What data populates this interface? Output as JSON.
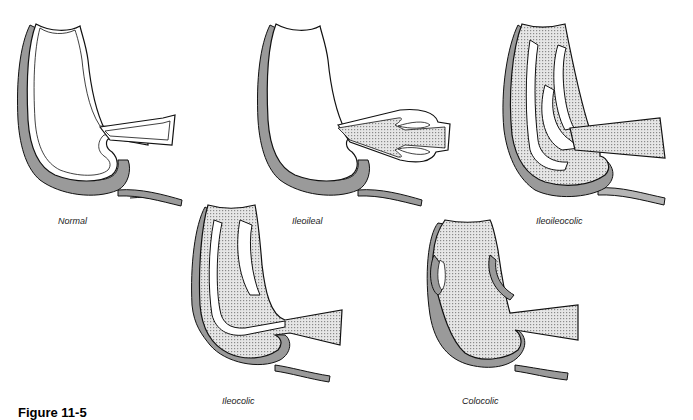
{
  "figure": {
    "caption": "Figure 11-5",
    "panels": [
      {
        "id": "normal",
        "label": "Normal"
      },
      {
        "id": "ileoileal",
        "label": "Ileoileal"
      },
      {
        "id": "ileoileocolic",
        "label": "Ileoileocolic"
      },
      {
        "id": "ileocolic",
        "label": "Ileocolic"
      },
      {
        "id": "colocolic",
        "label": "Colocolic"
      }
    ],
    "colors": {
      "serosa": "#9a9a9a",
      "wall": "#ffffff",
      "intussusceptum": "#d8d8d8",
      "outline": "#111111"
    }
  }
}
